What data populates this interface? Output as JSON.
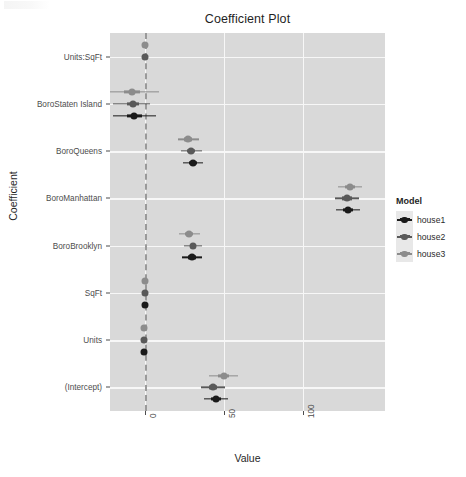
{
  "chart_data": {
    "type": "scatter",
    "title": "Coefficient Plot",
    "xlabel": "Value",
    "ylabel": "Coefficient",
    "xlim": [
      -22,
      152
    ],
    "xticks": [
      0,
      50,
      100
    ],
    "xtick_labels": [
      "0",
      "50",
      "100"
    ],
    "grid": true,
    "legend_position": "right",
    "legend_title": "Model",
    "reference_line": 0,
    "categories": [
      "Units:SqFt",
      "BoroStaten Island",
      "BoroQueens",
      "BoroManhattan",
      "BoroBrooklyn",
      "SqFt",
      "Units",
      "(Intercept)"
    ],
    "series": [
      {
        "name": "house1",
        "color": "#1a1a1a",
        "points": [
          {
            "category": "Units:SqFt",
            "value": null,
            "inner_low": null,
            "inner_high": null,
            "outer_low": null,
            "outer_high": null
          },
          {
            "category": "BoroStaten Island",
            "value": -6.5,
            "inner_low": -11.0,
            "inner_high": -2.0,
            "outer_low": -20.0,
            "outer_high": 7.0
          },
          {
            "category": "BoroQueens",
            "value": 30.5,
            "inner_low": 28.0,
            "inner_high": 33.0,
            "outer_low": 24.0,
            "outer_high": 37.0
          },
          {
            "category": "BoroManhattan",
            "value": 128.5,
            "inner_low": 125.5,
            "inner_high": 131.5,
            "outer_low": 121.0,
            "outer_high": 136.0
          },
          {
            "category": "BoroBrooklyn",
            "value": 30.0,
            "inner_low": 27.5,
            "inner_high": 32.5,
            "outer_low": 23.5,
            "outer_high": 36.5
          },
          {
            "category": "SqFt",
            "value": 0.0,
            "inner_low": 0.0,
            "inner_high": 0.0,
            "outer_low": 0.0,
            "outer_high": 0.0
          },
          {
            "category": "Units",
            "value": -0.3,
            "inner_low": -0.8,
            "inner_high": 0.2,
            "outer_low": -1.6,
            "outer_high": 1.0
          },
          {
            "category": "(Intercept)",
            "value": 45.0,
            "inner_low": 42.0,
            "inner_high": 48.0,
            "outer_low": 37.5,
            "outer_high": 52.5
          }
        ]
      },
      {
        "name": "house2",
        "color": "#595959",
        "points": [
          {
            "category": "Units:SqFt",
            "value": 0.0,
            "inner_low": 0.0,
            "inner_high": 0.0,
            "outer_low": -0.2,
            "outer_high": 0.2
          },
          {
            "category": "BoroStaten Island",
            "value": -7.5,
            "inner_low": -11.5,
            "inner_high": -3.5,
            "outer_low": -20.0,
            "outer_high": 3.0
          },
          {
            "category": "BoroQueens",
            "value": 29.5,
            "inner_low": 27.0,
            "inner_high": 32.0,
            "outer_low": 23.0,
            "outer_high": 36.0
          },
          {
            "category": "BoroManhattan",
            "value": 128.0,
            "inner_low": 125.0,
            "inner_high": 131.0,
            "outer_low": 120.5,
            "outer_high": 135.5
          },
          {
            "category": "BoroBrooklyn",
            "value": 30.5,
            "inner_low": 28.5,
            "inner_high": 32.5,
            "outer_low": 25.0,
            "outer_high": 36.0
          },
          {
            "category": "SqFt",
            "value": 0.0,
            "inner_low": 0.0,
            "inner_high": 0.0,
            "outer_low": 0.0,
            "outer_high": 0.0
          },
          {
            "category": "Units",
            "value": -0.2,
            "inner_low": -0.6,
            "inner_high": 0.2,
            "outer_low": -1.2,
            "outer_high": 0.8
          },
          {
            "category": "(Intercept)",
            "value": 43.0,
            "inner_low": 40.5,
            "inner_high": 45.5,
            "outer_low": 35.5,
            "outer_high": 50.5
          }
        ]
      },
      {
        "name": "house3",
        "color": "#8c8c8c",
        "points": [
          {
            "category": "Units:SqFt",
            "value": 0.0,
            "inner_low": 0.0,
            "inner_high": 0.0,
            "outer_low": -0.2,
            "outer_high": 0.2
          },
          {
            "category": "BoroStaten Island",
            "value": -8.0,
            "inner_low": -13.0,
            "inner_high": -3.0,
            "outer_low": -22.0,
            "outer_high": 9.0
          },
          {
            "category": "BoroQueens",
            "value": 27.5,
            "inner_low": 25.0,
            "inner_high": 30.0,
            "outer_low": 21.0,
            "outer_high": 34.5
          },
          {
            "category": "BoroManhattan",
            "value": 130.0,
            "inner_low": 127.0,
            "inner_high": 133.0,
            "outer_low": 122.5,
            "outer_high": 137.5
          },
          {
            "category": "BoroBrooklyn",
            "value": 28.0,
            "inner_low": 25.5,
            "inner_high": 30.5,
            "outer_low": 21.5,
            "outer_high": 35.0
          },
          {
            "category": "SqFt",
            "value": 0.0,
            "inner_low": 0.0,
            "inner_high": 0.0,
            "outer_low": 0.0,
            "outer_high": 0.0
          },
          {
            "category": "Units",
            "value": -0.2,
            "inner_low": -0.6,
            "inner_high": 0.2,
            "outer_low": -1.2,
            "outer_high": 0.8
          },
          {
            "category": "(Intercept)",
            "value": 50.0,
            "inner_low": 46.5,
            "inner_high": 53.5,
            "outer_low": 40.5,
            "outer_high": 59.0
          }
        ]
      }
    ]
  },
  "legend": {
    "title": "Model",
    "entries": [
      {
        "label": "house1",
        "color": "#1a1a1a"
      },
      {
        "label": "house2",
        "color": "#595959"
      },
      {
        "label": "house3",
        "color": "#8c8c8c"
      }
    ]
  },
  "theme": {
    "panel_background": "#d9d9d9",
    "grid_color": "#f7f7f7",
    "reference_line_color": "#9a9a9a",
    "text_color": "#2b2b2b",
    "page_background": "#ffffff"
  }
}
